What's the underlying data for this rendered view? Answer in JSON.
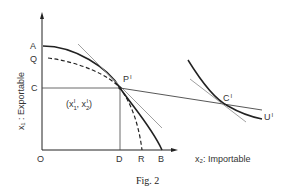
{
  "figure": {
    "caption": "Fig. 2",
    "y_axis_label": "x₁ : Exportable",
    "x_axis_label": "x₂: Importable",
    "points": {
      "origin": "O",
      "A": "A",
      "Q": "Q",
      "C": "C",
      "D": "D",
      "R": "R",
      "B": "B",
      "P1": "P",
      "P1_sup": "I",
      "C1": "C",
      "C1_sup": "I",
      "U1": "U",
      "U1_sup": "I"
    },
    "coordinate_label": {
      "open": "(x",
      "x1_sub": "1",
      "x1_sup": "I",
      "sep": ", x",
      "x2_sub": "2",
      "x2_sup": "I",
      "close": ")"
    },
    "curves": [
      {
        "name": "production-frontier-AB",
        "style": "solid"
      },
      {
        "name": "production-frontier-QR",
        "style": "dashed"
      },
      {
        "name": "indifference-curve-U1",
        "style": "solid"
      },
      {
        "name": "price-line-through-P1",
        "style": "thin"
      },
      {
        "name": "trade-line-C-P1-C1",
        "style": "solid"
      },
      {
        "name": "tangent-at-C1",
        "style": "thin"
      }
    ],
    "colors": {
      "ink": "#222222",
      "thin_line": "#777777"
    }
  }
}
